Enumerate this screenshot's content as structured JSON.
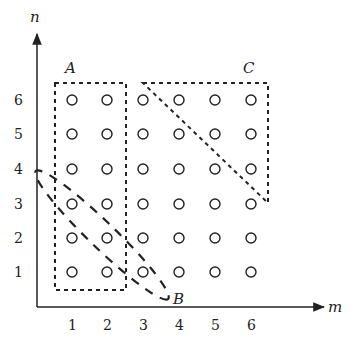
{
  "figure": {
    "axes": {
      "x_label": "m",
      "y_label": "n",
      "x_ticks": [
        "1",
        "2",
        "3",
        "4",
        "5",
        "6"
      ],
      "y_ticks": [
        "1",
        "2",
        "3",
        "4",
        "5",
        "6"
      ]
    },
    "grid_points": {
      "cols": [
        1,
        2,
        3,
        4,
        5,
        6
      ],
      "rows": [
        1,
        2,
        3,
        4,
        5,
        6
      ],
      "marker": "open-circle"
    },
    "regions": [
      {
        "label": "A",
        "shape": "dotted rectangle",
        "covers": "m in {1,2}, n in {1..6}"
      },
      {
        "label": "B",
        "shape": "dashed diagonal band",
        "covers": "anti-diagonal from (1,3)/(1,4) to (3,1)"
      },
      {
        "label": "C",
        "shape": "dotted triangle",
        "covers": "upper-right triangle m in {3..6}, n in {3..6}"
      }
    ],
    "colors": {
      "ink": "#222222",
      "background": "#ffffff"
    }
  }
}
